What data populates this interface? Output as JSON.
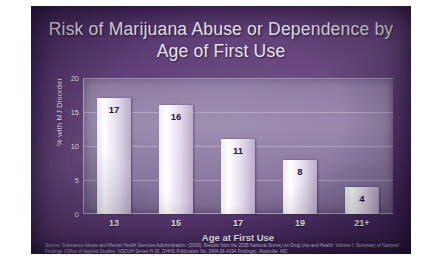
{
  "slide": {
    "title": "Risk of Marijuana Abuse or Dependence by Age of First Use",
    "source": "Source: Substance Abuse and Mental Health Services Administration. (2006). Results from the 2005 National Survey on Drug Use and Health: Volume I. Summary of National Findings (Office of Applied Studies, NSDUH Series H-30, DHHS Publication No. SMA 06-4194 Findings). Rockville, MD."
  },
  "chart_data": {
    "type": "bar",
    "title": "Risk of Marijuana Abuse or Dependence by Age of First Use",
    "xlabel": "Age at First Use",
    "ylabel": "% with MJ Disorder",
    "categories": [
      "13",
      "15",
      "17",
      "19",
      "21+"
    ],
    "values": [
      17,
      16,
      11,
      8,
      4
    ],
    "data_labels": [
      "17",
      "16",
      "11",
      "8",
      "4"
    ],
    "yticks": [
      0,
      5,
      10,
      15,
      20
    ],
    "ytick_labels": [
      "0",
      "5",
      "10",
      "15",
      "20"
    ],
    "ylim": [
      0,
      20
    ],
    "grid": true,
    "legend": "none",
    "bar_color": "#f2ecf7",
    "panel_color": "#8d7ba2",
    "background_color": "#5a3a72",
    "title_color": "#e9e2f2"
  }
}
